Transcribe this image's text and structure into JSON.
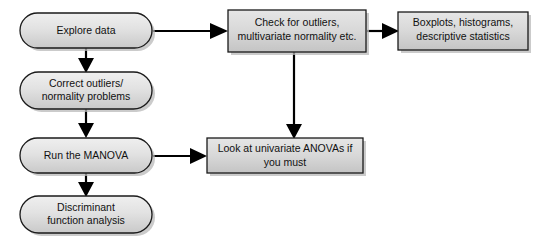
{
  "diagram": {
    "background_color": "#ffffff",
    "node_fill_color": "#d6d6d6",
    "node_border_color": "#1a1a1a",
    "edge_color": "#000000",
    "nodes": [
      {
        "id": "explore-data",
        "shape": "stadium",
        "lines": [
          "Explore data"
        ],
        "x": 20,
        "y": 13,
        "w": 132,
        "h": 35
      },
      {
        "id": "correct-outliers",
        "shape": "stadium",
        "lines": [
          "Correct outliers/",
          "normality problems"
        ],
        "x": 20,
        "y": 72,
        "w": 132,
        "h": 37
      },
      {
        "id": "run-manova",
        "shape": "stadium",
        "lines": [
          "Run the MANOVA"
        ],
        "x": 20,
        "y": 138,
        "w": 132,
        "h": 35
      },
      {
        "id": "discriminant-function-analysis",
        "shape": "stadium",
        "lines": [
          "Discriminant",
          "function analysis"
        ],
        "x": 20,
        "y": 196,
        "w": 132,
        "h": 37
      },
      {
        "id": "check-outliers",
        "shape": "rectangle",
        "lines": [
          "Check for outliers,",
          "multivariate normality etc."
        ],
        "x": 228,
        "y": 10,
        "w": 138,
        "h": 42
      },
      {
        "id": "boxplots-histograms",
        "shape": "rectangle",
        "lines": [
          "Boxplots, histograms,",
          "descriptive statistics"
        ],
        "x": 398,
        "y": 12,
        "w": 130,
        "h": 38
      },
      {
        "id": "univariate-anovas",
        "shape": "rectangle",
        "lines": [
          "Look at univariate ANOVAs if",
          "you must"
        ],
        "x": 207,
        "y": 138,
        "w": 156,
        "h": 35
      }
    ],
    "edges": [
      {
        "id": "explore-to-check",
        "from": "explore-data",
        "to": "check-outliers",
        "direction": "right"
      },
      {
        "id": "explore-to-correct",
        "from": "explore-data",
        "to": "correct-outliers",
        "direction": "down"
      },
      {
        "id": "correct-to-manova",
        "from": "correct-outliers",
        "to": "run-manova",
        "direction": "down"
      },
      {
        "id": "manova-to-discriminant",
        "from": "run-manova",
        "to": "discriminant-function-analysis",
        "direction": "down"
      },
      {
        "id": "check-to-boxplots",
        "from": "check-outliers",
        "to": "boxplots-histograms",
        "direction": "right"
      },
      {
        "id": "check-to-anovas",
        "from": "check-outliers",
        "to": "univariate-anovas",
        "direction": "down"
      },
      {
        "id": "manova-to-anovas",
        "from": "run-manova",
        "to": "univariate-anovas",
        "direction": "right"
      }
    ]
  }
}
